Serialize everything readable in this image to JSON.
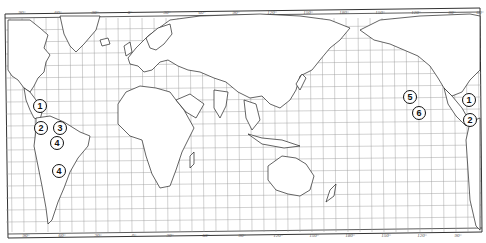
{
  "map": {
    "type": "world outline map with graticule",
    "colors": {
      "background": "#ffffff",
      "grid": "#8a8a8a",
      "coast": "#222222",
      "frame": "#333333"
    },
    "top_longitude_labels": [
      {
        "x": 22,
        "text": "90°"
      },
      {
        "x": 58,
        "text": "60°"
      },
      {
        "x": 95,
        "text": "30°"
      },
      {
        "x": 130,
        "text": "0°"
      },
      {
        "x": 167,
        "text": "30°"
      },
      {
        "x": 202,
        "text": "60°"
      },
      {
        "x": 236,
        "text": "90°"
      },
      {
        "x": 272,
        "text": "120°"
      },
      {
        "x": 308,
        "text": "150°"
      },
      {
        "x": 344,
        "text": "180°"
      },
      {
        "x": 380,
        "text": "150°"
      },
      {
        "x": 416,
        "text": "120°"
      },
      {
        "x": 452,
        "text": "90°"
      },
      {
        "x": 480,
        "text": "60°"
      }
    ],
    "bottom_longitude_labels": [
      {
        "x": 26,
        "text": "90°"
      },
      {
        "x": 62,
        "text": "60°"
      },
      {
        "x": 98,
        "text": "30°"
      },
      {
        "x": 134,
        "text": "0°"
      },
      {
        "x": 170,
        "text": "30°"
      },
      {
        "x": 206,
        "text": "60°"
      },
      {
        "x": 242,
        "text": "90°"
      },
      {
        "x": 278,
        "text": "120°"
      },
      {
        "x": 314,
        "text": "150°"
      },
      {
        "x": 350,
        "text": "180°"
      },
      {
        "x": 386,
        "text": "150°"
      },
      {
        "x": 422,
        "text": "120°"
      },
      {
        "x": 458,
        "text": "90°"
      }
    ],
    "markers": [
      {
        "id": "1",
        "label": "1",
        "x": 40,
        "y": 106
      },
      {
        "id": "2",
        "label": "2",
        "x": 41,
        "y": 128
      },
      {
        "id": "3",
        "label": "3",
        "x": 60,
        "y": 128
      },
      {
        "id": "4a",
        "label": "4",
        "x": 57,
        "y": 143
      },
      {
        "id": "4b",
        "label": "4",
        "x": 59,
        "y": 171
      },
      {
        "id": "5",
        "label": "5",
        "x": 410,
        "y": 97
      },
      {
        "id": "6",
        "label": "6",
        "x": 419,
        "y": 113
      },
      {
        "id": "1b",
        "label": "1",
        "x": 469,
        "y": 100
      },
      {
        "id": "2b",
        "label": "2",
        "x": 470,
        "y": 120
      }
    ]
  }
}
